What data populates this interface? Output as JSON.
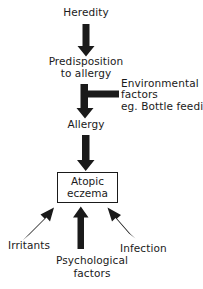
{
  "diagram": {
    "type": "flow-diagram",
    "background_color": "#ffffff",
    "ink_color": "#1a1a1a",
    "nodes": {
      "heredity": {
        "label": "Heredity"
      },
      "predisposition": {
        "label": "Predisposition\nto allergy"
      },
      "environmental": {
        "label": "Environmental\nfactors\neg. Bottle feeding"
      },
      "allergy": {
        "label": "Allergy"
      },
      "atopic_eczema": {
        "label": "Atopic\neczema",
        "shape": "rectangle"
      },
      "irritants": {
        "label": "Irritants"
      },
      "psychological": {
        "label": "Psychological\nfactors"
      },
      "infection": {
        "label": "Infection"
      }
    },
    "edges": [
      {
        "from": "heredity",
        "to": "predisposition",
        "style": "solid-block-arrow",
        "direction": "down"
      },
      {
        "from": "predisposition",
        "to": "allergy",
        "style": "solid-block-arrow",
        "direction": "down"
      },
      {
        "from": "environmental",
        "to": "allergy",
        "style": "solid-block-arrow",
        "direction": "left-then-down"
      },
      {
        "from": "allergy",
        "to": "atopic_eczema",
        "style": "solid-block-arrow",
        "direction": "down"
      },
      {
        "from": "irritants",
        "to": "atopic_eczema",
        "style": "solid-block-arrow",
        "direction": "up-right-diagonal"
      },
      {
        "from": "psychological",
        "to": "atopic_eczema",
        "style": "solid-block-arrow",
        "direction": "up"
      },
      {
        "from": "infection",
        "to": "atopic_eczema",
        "style": "solid-block-arrow",
        "direction": "up-left-diagonal"
      }
    ]
  }
}
